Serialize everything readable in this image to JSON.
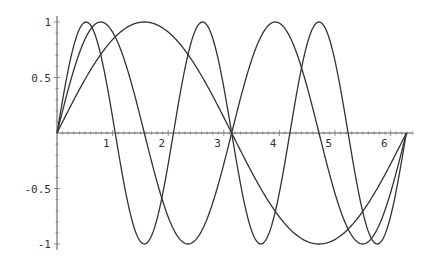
{
  "chart_data": {
    "type": "line",
    "title": "",
    "xlabel": "",
    "ylabel": "",
    "xlim": [
      0,
      6.4
    ],
    "ylim": [
      -1,
      1
    ],
    "grid": false,
    "legend": null,
    "x_ticks": [
      "1",
      "2",
      "3",
      "4",
      "5",
      "6"
    ],
    "y_ticks": [
      "1",
      "0.5",
      "-0.5",
      "-1"
    ],
    "domain": [
      0,
      6.2832
    ],
    "series": [
      {
        "name": "sin(x)",
        "frequency": 1
      },
      {
        "name": "sin(2x)",
        "frequency": 2
      },
      {
        "name": "sin(3x)",
        "frequency": 3
      }
    ],
    "line_color": "#333333"
  },
  "layout": {
    "origin_x": 57,
    "origin_y": 133,
    "px_per_x": 55.6,
    "px_per_y": 111,
    "axis_x_end": 413,
    "axis_y_top": 16,
    "axis_y_bottom": 250
  }
}
